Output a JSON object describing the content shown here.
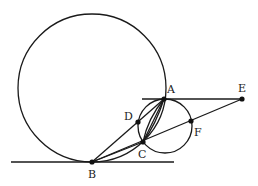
{
  "diagram": {
    "type": "geometry",
    "stroke_color": "#1a1a1a",
    "background": "#ffffff",
    "circles": [
      {
        "name": "large-circle",
        "cx": 92,
        "cy": 88,
        "r": 74
      },
      {
        "name": "small-circle",
        "cx": 165,
        "cy": 126,
        "r": 27
      }
    ],
    "lines": [
      {
        "name": "tangent-line-b",
        "x1": 11,
        "y1": 162,
        "x2": 174,
        "y2": 162
      },
      {
        "name": "tangent-line-ae",
        "x1": 142,
        "y1": 99,
        "x2": 242,
        "y2": 99
      },
      {
        "name": "segment-be",
        "x1": 92,
        "y1": 162,
        "x2": 242,
        "y2": 99
      },
      {
        "name": "segment-ba",
        "x1": 92,
        "y1": 162,
        "x2": 164,
        "y2": 99
      },
      {
        "name": "segment-bc",
        "x1": 92,
        "y1": 162,
        "x2": 143,
        "y2": 142
      },
      {
        "name": "segment-ac",
        "x1": 164,
        "y1": 99,
        "x2": 143,
        "y2": 142
      }
    ],
    "arcs": [
      {
        "name": "arc-ac-inner",
        "d": "M164,99 Q148,118 143,142"
      },
      {
        "name": "arc-ac-outer",
        "d": "M164,99 Q156,124 143,142"
      }
    ],
    "points": [
      {
        "label": "A",
        "x": 164,
        "y": 99,
        "lx": 167,
        "ly": 93
      },
      {
        "label": "B",
        "x": 92,
        "y": 162,
        "lx": 88,
        "ly": 178
      },
      {
        "label": "C",
        "x": 143,
        "y": 142,
        "lx": 138,
        "ly": 158
      },
      {
        "label": "D",
        "x": 138,
        "y": 122,
        "lx": 124,
        "ly": 120
      },
      {
        "label": "E",
        "x": 242,
        "y": 99,
        "lx": 238,
        "ly": 92
      },
      {
        "label": "F",
        "x": 191,
        "y": 121,
        "lx": 194,
        "ly": 136
      }
    ]
  }
}
